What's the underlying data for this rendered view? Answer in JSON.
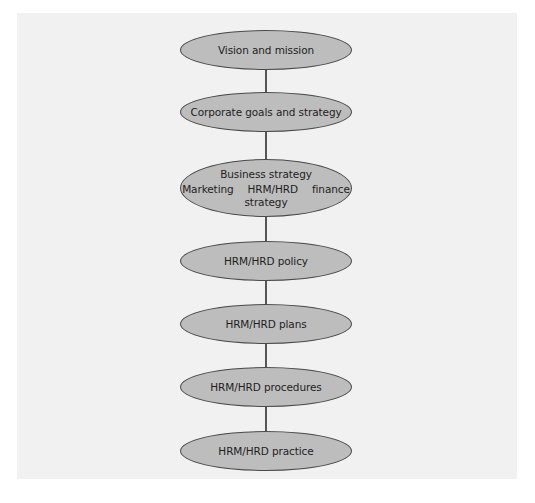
{
  "diagram": {
    "type": "hierarchy-flow",
    "colors": {
      "background": "#ffffff",
      "panel": "#f1f1f1",
      "node_fill": "#bdbdbd",
      "node_border": "#4a4a4a",
      "connector": "#555555",
      "text": "#1e1e1e"
    },
    "nodes": [
      {
        "id": "vision",
        "label": "Vision and mission"
      },
      {
        "id": "corporate",
        "label": "Corporate goals and strategy"
      },
      {
        "id": "business",
        "label": "Business strategy",
        "sub_items": [
          "Marketing",
          "HRM/HRD",
          "finance"
        ],
        "sub_suffix": "strategy"
      },
      {
        "id": "policy",
        "label": "HRM/HRD policy"
      },
      {
        "id": "plans",
        "label": "HRM/HRD plans"
      },
      {
        "id": "procedures",
        "label": "HRM/HRD procedures"
      },
      {
        "id": "practice",
        "label": "HRM/HRD practice"
      }
    ],
    "edges": [
      [
        "vision",
        "corporate"
      ],
      [
        "corporate",
        "business"
      ],
      [
        "business",
        "policy"
      ],
      [
        "policy",
        "plans"
      ],
      [
        "plans",
        "procedures"
      ],
      [
        "procedures",
        "practice"
      ]
    ]
  }
}
